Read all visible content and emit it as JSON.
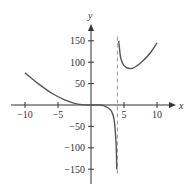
{
  "chart_data": {
    "type": "line",
    "title": "",
    "xlabel": "x",
    "ylabel": "y",
    "xlim": [
      -12,
      12.5
    ],
    "ylim": [
      -175,
      175
    ],
    "grid": false,
    "x_ticks": [
      -10,
      -5,
      5,
      10
    ],
    "x_tick_labels": [
      "−10",
      "−5",
      "5",
      "10"
    ],
    "y_ticks": [
      150,
      100,
      50,
      -50,
      -100,
      -150
    ],
    "y_tick_labels": [
      "150",
      "100",
      "50",
      "−50",
      "−100",
      "−150"
    ],
    "asymptotes": [
      {
        "type": "vertical",
        "x": 4,
        "style": "dashed"
      }
    ],
    "series": [
      {
        "name": "left branch",
        "x": [
          -10,
          -8,
          -6,
          -4,
          -2,
          0,
          1,
          2,
          3,
          3.5,
          3.8,
          3.9
        ],
        "y": [
          75,
          50,
          28,
          12,
          2,
          0,
          0,
          -2,
          -12,
          -35,
          -90,
          -150
        ]
      },
      {
        "name": "right branch",
        "x": [
          4.2,
          4.5,
          5,
          6,
          7,
          8,
          9,
          10
        ],
        "y": [
          150,
          110,
          92,
          85,
          92,
          105,
          122,
          145
        ]
      }
    ]
  }
}
